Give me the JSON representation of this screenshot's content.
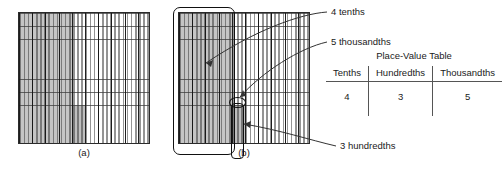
{
  "figure": {
    "type": "decimal-place-value-grids",
    "number_represented": "0.435",
    "grid_a": {
      "label": "(a)",
      "columns": 10,
      "rows": 10,
      "subdivisions_per_column": 10,
      "shaded_full_columns": 4,
      "extra_shaded_cell_note": "3 hundredths block in lower region"
    },
    "grid_b": {
      "label": "(b)",
      "columns": 10,
      "rows": 10,
      "subdivisions_per_column": 10,
      "shaded_full_columns": 4
    }
  },
  "annotations": [
    {
      "id": "tenths",
      "text": "4 tenths"
    },
    {
      "id": "thousandths",
      "text": "5 thousandths"
    },
    {
      "id": "hundredths",
      "text": "3 hundredths"
    }
  ],
  "place_value_table": {
    "title": "Place-Value Table",
    "headers": [
      "Tenths",
      "Hundredths",
      "Thousandths"
    ],
    "values": [
      "4",
      "3",
      "5"
    ]
  },
  "colors": {
    "shade": "#9a9a9a",
    "line": "#2b2b2b",
    "text": "#1a1a1a"
  }
}
